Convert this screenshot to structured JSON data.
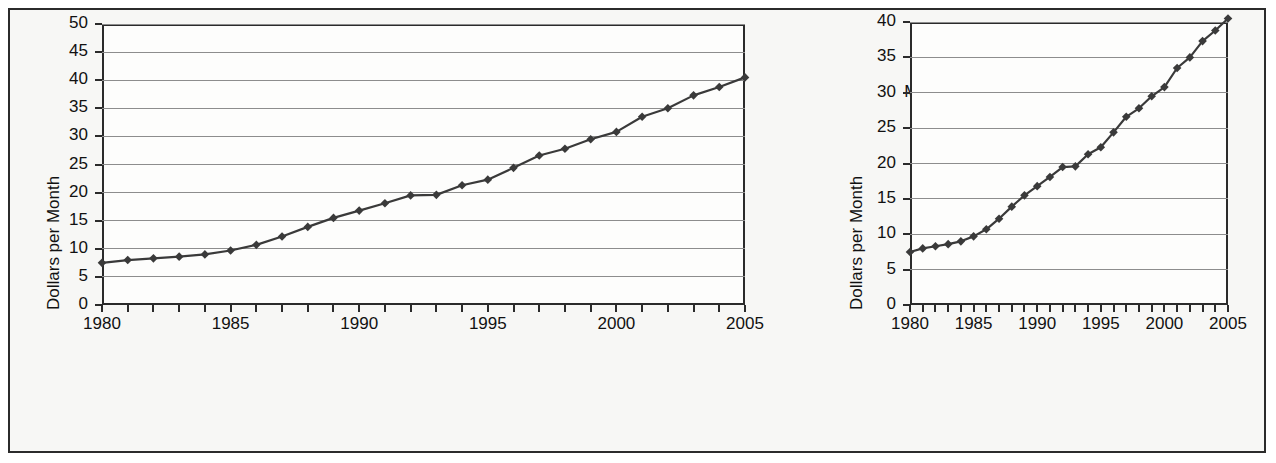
{
  "figure": {
    "background": "#f7f7f5",
    "border_color": "#2b2b2b"
  },
  "panels": [
    {
      "key": "stretched",
      "label": "Stretched",
      "title": "Monthly Basic Rate for Cable TV",
      "ylabel": "Dollars per Month",
      "ylim": [
        0,
        50
      ],
      "yticks": [
        0,
        5,
        10,
        15,
        20,
        25,
        30,
        35,
        40,
        45,
        50
      ],
      "xlim": [
        1980,
        2005
      ],
      "xticklabels": [
        1980,
        1985,
        1990,
        1995,
        2000,
        2005
      ]
    },
    {
      "key": "squeezed",
      "label": "Squeezed",
      "title": "Monthly Basic Rate for Cable TV",
      "ylabel": "Dollars per Month",
      "ylim": [
        0,
        40
      ],
      "yticks": [
        0,
        5,
        10,
        15,
        20,
        25,
        30,
        35,
        40
      ],
      "xlim": [
        1980,
        2005
      ],
      "xticklabels": [
        1980,
        1985,
        1990,
        1995,
        2000,
        2005
      ]
    }
  ],
  "chart_data": [
    {
      "type": "line",
      "title": "Monthly Basic Rate for Cable TV",
      "panel_label": "Stretched",
      "xlabel": "",
      "ylabel": "Dollars per Month",
      "xlim": [
        1980,
        2005
      ],
      "ylim": [
        0,
        50
      ],
      "yticks": [
        0,
        5,
        10,
        15,
        20,
        25,
        30,
        35,
        40,
        45,
        50
      ],
      "xticklabels": [
        1980,
        1985,
        1990,
        1995,
        2000,
        2005
      ],
      "grid": "horizontal",
      "legend": "none",
      "marker": "diamond",
      "line_color": "#3a3a3a",
      "x": [
        1980,
        1981,
        1982,
        1983,
        1984,
        1985,
        1986,
        1987,
        1988,
        1989,
        1990,
        1991,
        1992,
        1993,
        1994,
        1995,
        1996,
        1997,
        1998,
        1999,
        2000,
        2001,
        2002,
        2003,
        2004,
        2005
      ],
      "values": [
        7.5,
        8.0,
        8.3,
        8.6,
        9.0,
        9.7,
        10.7,
        12.2,
        13.9,
        15.5,
        16.8,
        18.1,
        19.5,
        19.6,
        21.3,
        22.3,
        24.4,
        26.6,
        27.8,
        29.5,
        30.8,
        33.5,
        35.0,
        37.3,
        38.8,
        40.5
      ]
    },
    {
      "type": "line",
      "title": "Monthly Basic Rate for Cable TV",
      "panel_label": "Squeezed",
      "xlabel": "",
      "ylabel": "Dollars per Month",
      "xlim": [
        1980,
        2005
      ],
      "ylim": [
        0,
        40
      ],
      "yticks": [
        0,
        5,
        10,
        15,
        20,
        25,
        30,
        35,
        40
      ],
      "xticklabels": [
        1980,
        1985,
        1990,
        1995,
        2000,
        2005
      ],
      "grid": "horizontal",
      "legend": "none",
      "marker": "diamond",
      "line_color": "#3a3a3a",
      "x": [
        1980,
        1981,
        1982,
        1983,
        1984,
        1985,
        1986,
        1987,
        1988,
        1989,
        1990,
        1991,
        1992,
        1993,
        1994,
        1995,
        1996,
        1997,
        1998,
        1999,
        2000,
        2001,
        2002,
        2003,
        2004,
        2005
      ],
      "values": [
        7.5,
        8.0,
        8.3,
        8.6,
        9.0,
        9.7,
        10.7,
        12.2,
        13.9,
        15.5,
        16.8,
        18.1,
        19.5,
        19.6,
        21.3,
        22.3,
        24.4,
        26.6,
        27.8,
        29.5,
        30.8,
        33.5,
        35.0,
        37.3,
        38.8,
        40.5
      ]
    }
  ]
}
